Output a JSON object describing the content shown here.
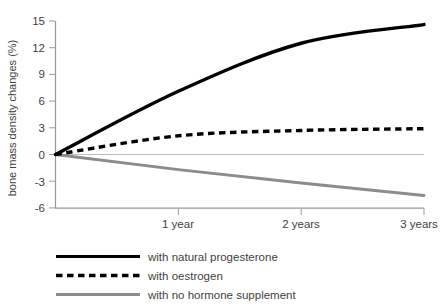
{
  "chart_data": {
    "type": "line",
    "title": "",
    "xlabel": "",
    "ylabel": "bone mass density changes (%)",
    "x": [
      0,
      1,
      2,
      3
    ],
    "categories": [
      "",
      "1 year",
      "2 years",
      "3 years"
    ],
    "xtick_labels": [
      "1 year",
      "2 years",
      "3 years"
    ],
    "xtick_values": [
      1,
      2,
      3
    ],
    "ytick_labels": [
      "15",
      "12",
      "9",
      "6",
      "3",
      "0",
      "-3",
      "-6"
    ],
    "ytick_values": [
      15,
      12,
      9,
      6,
      3,
      0,
      -3,
      -6
    ],
    "ylim": [
      -6,
      15
    ],
    "xlim": [
      0,
      3
    ],
    "grid": false,
    "zero_line": true,
    "legend_position": "bottom-left",
    "series": [
      {
        "name": "with natural progesterone",
        "style": "solid",
        "color": "#000000",
        "width": 3,
        "values": [
          0,
          7.1,
          12.5,
          14.6
        ],
        "x": [
          0,
          1,
          2,
          3
        ]
      },
      {
        "name": "with oestrogen",
        "style": "dashed",
        "color": "#000000",
        "width": 3,
        "values": [
          0,
          2.1,
          2.7,
          2.9
        ],
        "x": [
          0,
          1,
          2,
          3
        ]
      },
      {
        "name": "with no hormone supplement",
        "style": "solid",
        "color": "#8c8c8c",
        "width": 3,
        "values": [
          0,
          -1.7,
          -3.2,
          -4.6
        ],
        "x": [
          0,
          1,
          2,
          3
        ]
      }
    ]
  },
  "axis": {
    "y_title": "bone mass density changes (%)",
    "y_ticks": [
      {
        "label": "15",
        "value": 15
      },
      {
        "label": "12",
        "value": 12
      },
      {
        "label": "9",
        "value": 9
      },
      {
        "label": "6",
        "value": 6
      },
      {
        "label": "3",
        "value": 3
      },
      {
        "label": "0",
        "value": 0
      },
      {
        "label": "-3",
        "value": -3
      },
      {
        "label": "-6",
        "value": -6
      }
    ],
    "x_ticks": [
      {
        "label": "1 year",
        "value": 1
      },
      {
        "label": "2 years",
        "value": 2
      },
      {
        "label": "3 years",
        "value": 3
      }
    ]
  },
  "legend": {
    "items": [
      {
        "label": "with natural progesterone",
        "style": "solid",
        "color": "#000000"
      },
      {
        "label": "with oestrogen",
        "style": "dashed",
        "color": "#000000"
      },
      {
        "label": "with no hormone supplement",
        "style": "solid",
        "color": "#8c8c8c"
      }
    ]
  },
  "colors": {
    "axis": "#9a9a9a",
    "text": "#3f3f3f",
    "progesterone": "#000000",
    "oestrogen": "#000000",
    "no_supplement": "#8c8c8c",
    "zero_line": "#b5b5b5",
    "background": "#ffffff"
  }
}
